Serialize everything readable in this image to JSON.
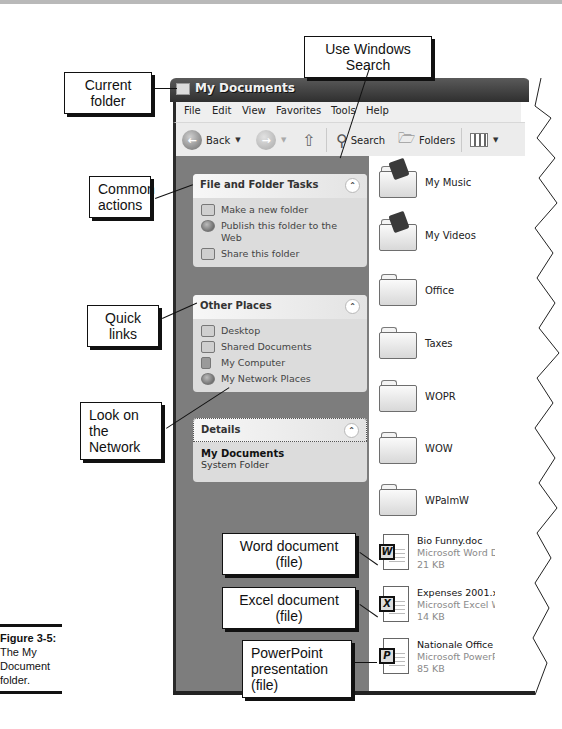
{
  "window": {
    "title": "My Documents",
    "menu": [
      "File",
      "Edit",
      "View",
      "Favorites",
      "Tools",
      "Help"
    ],
    "toolbar": {
      "back_label": "Back",
      "search_label": "Search",
      "folders_label": "Folders"
    }
  },
  "left_pane": {
    "file_tasks": {
      "title": "File and Folder Tasks",
      "items": [
        "Make a new folder",
        "Publish this folder to the Web",
        "Share this folder"
      ]
    },
    "other_places": {
      "title": "Other Places",
      "items": [
        "Desktop",
        "Shared Documents",
        "My Computer",
        "My Network Places"
      ]
    },
    "details": {
      "title": "Details",
      "name": "My Documents",
      "type": "System Folder"
    }
  },
  "content": {
    "folders": [
      "My Music",
      "My Videos",
      "Office",
      "Taxes",
      "WOPR",
      "WOW",
      "WPalmW"
    ],
    "files": [
      {
        "name": "Bio Funny.doc",
        "type": "Microsoft Word Document",
        "size": "21 KB",
        "app": "W"
      },
      {
        "name": "Expenses 2001.xls",
        "type": "Microsoft Excel Worksheet",
        "size": "14 KB",
        "app": "X"
      },
      {
        "name": "Nationale Office Dag.ppt",
        "type": "Microsoft PowerPoint Presentation",
        "size": "85 KB",
        "app": "P"
      }
    ]
  },
  "callouts": {
    "search": "Use Windows Search",
    "current_folder": "Current folder",
    "common_actions": "Common actions",
    "quick_links": "Quick links",
    "network": "Look on the Network",
    "word": "Word document (file)",
    "excel": "Excel document (file)",
    "powerpoint": "PowerPoint presentation (file)"
  },
  "caption": {
    "label": "Figure 3-5:",
    "text": "The My Document folder."
  }
}
